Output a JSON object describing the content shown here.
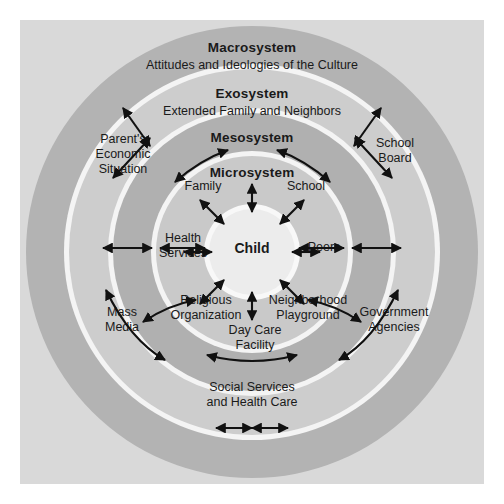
{
  "diagram": {
    "center": {
      "label": "Child"
    },
    "systems": [
      {
        "name": "macrosystem",
        "title": "Macrosystem",
        "subtitle": "Attitudes and Ideologies of the Culture"
      },
      {
        "name": "exosystem",
        "title": "Exosystem",
        "subtitle": "Extended Family and Neighbors"
      },
      {
        "name": "mesosystem",
        "title": "Mesosystem",
        "subtitle": ""
      },
      {
        "name": "microsystem",
        "title": "Microsystem",
        "subtitle": ""
      }
    ],
    "microsystem_nodes": [
      {
        "name": "family",
        "label": "Family"
      },
      {
        "name": "school",
        "label": "School"
      },
      {
        "name": "health-services",
        "label": "Health\nServices"
      },
      {
        "name": "peers",
        "label": "Peers"
      },
      {
        "name": "religious-organization",
        "label": "Religious\nOrganization"
      },
      {
        "name": "neighborhood-playground",
        "label": "Neighborhood\nPlayground"
      },
      {
        "name": "day-care-facility",
        "label": "Day Care\nFacility"
      }
    ],
    "exosystem_nodes": [
      {
        "name": "parents-economic-situation",
        "label": "Parent's\nEconomic\nSituation"
      },
      {
        "name": "school-board",
        "label": "School\nBoard"
      },
      {
        "name": "mass-media",
        "label": "Mass\nMedia"
      },
      {
        "name": "government-agencies",
        "label": "Government\nAgencies"
      },
      {
        "name": "social-services-health-care",
        "label": "Social Services\nand Health Care"
      }
    ],
    "colors": {
      "page_background": "#ffffff",
      "panel_background": "#d9d9d9",
      "macrosystem_ring": "#b3b3b3",
      "exosystem_ring": "#cdcdcd",
      "mesosystem_ring": "#b0b0b0",
      "microsystem_ring": "#c9c9c9",
      "child_circle": "#ececec",
      "ring_divider": "#f4f4f4",
      "arrow": "#111111",
      "text": "#1a1a1a"
    }
  }
}
